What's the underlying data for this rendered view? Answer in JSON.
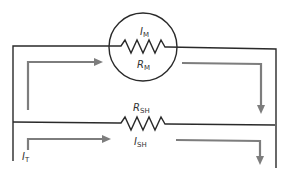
{
  "diagram": {
    "type": "ammeter shunt circuit",
    "labels": {
      "meter_current": {
        "main": "I",
        "sub": "M"
      },
      "meter_resistance": {
        "main": "R",
        "sub": "M"
      },
      "shunt_resistance": {
        "main": "R",
        "sub": "SH"
      },
      "shunt_current": {
        "main": "I",
        "sub": "SH"
      },
      "total_current": {
        "main": "I",
        "sub": "T"
      }
    },
    "colors": {
      "wire": "#2a2a2a",
      "current_arrow": "#7d7d7d"
    }
  }
}
